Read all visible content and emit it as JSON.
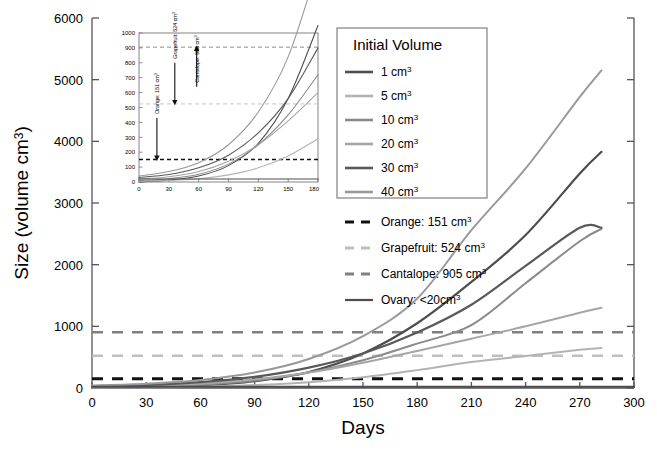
{
  "figure": {
    "axis": {
      "ylabel": "Size (volume cm3)",
      "ylabel_base": "Size (volume cm",
      "ylabel_sup": "3",
      "ylabel_tail": ")",
      "xlabel": "Days",
      "yticks": [
        0,
        1000,
        2000,
        3000,
        4000,
        5000,
        6000
      ],
      "xticks": [
        0,
        30,
        60,
        90,
        120,
        150,
        180,
        210,
        240,
        270,
        300
      ],
      "ylim": [
        0,
        6000
      ],
      "xlim": [
        0,
        300
      ],
      "grid": false
    },
    "legend": {
      "title": "Initial  Volume",
      "items": [
        {
          "label": "1 cm",
          "sup": "3",
          "color": "#4d4d4d"
        },
        {
          "label": "5 cm",
          "sup": "3",
          "color": "#b3b3b3"
        },
        {
          "label": "10 cm",
          "sup": "3",
          "color": "#8a8a8a"
        },
        {
          "label": "20 cm",
          "sup": "3",
          "color": "#a6a6a6"
        },
        {
          "label": "30 cm",
          "sup": "3",
          "color": "#595959"
        },
        {
          "label": "40 cm",
          "sup": "3",
          "color": "#999999"
        }
      ]
    },
    "reference_legend": [
      {
        "label": "Orange: 151 cm",
        "sup": "3",
        "color": "#111111",
        "style": "dashed"
      },
      {
        "label": "Grapefruit: 524 cm",
        "sup": "3",
        "color": "#bfbfbf",
        "style": "dashed"
      },
      {
        "label": "Cantalope:  905 cm",
        "sup": "3",
        "color": "#808080",
        "style": "dashed"
      },
      {
        "label": "Ovary: <20cm",
        "sup": "3",
        "color": "#4d4d4d",
        "style": "solid"
      }
    ],
    "inset": {
      "yticks": [
        0,
        100,
        200,
        300,
        400,
        500,
        600,
        700,
        800,
        900,
        1000
      ],
      "xticks": [
        0,
        30,
        60,
        90,
        120,
        150,
        180
      ],
      "ylim": [
        0,
        1000
      ],
      "xlim": [
        0,
        180
      ],
      "annotations": [
        {
          "text": "Orange: 151 cm3",
          "label": "Orange: 151 cm",
          "sup": "3",
          "x": 18,
          "y_from": 430,
          "y_to": 160
        },
        {
          "text": "Grapefruit: 524 cm3",
          "label": "Grapefruit: 524 cm",
          "sup": "3",
          "x": 36,
          "y_from": 800,
          "y_to": 533
        },
        {
          "text": "Cantalope: 905 cm3",
          "label": "Cantalope: 905 cm",
          "sup": "3",
          "x": 58,
          "y_from": 640,
          "y_to": 898
        }
      ]
    }
  },
  "chart_data": {
    "type": "line",
    "title": "",
    "xlabel": "Days",
    "ylabel": "Size (volume cm3)",
    "xlim": [
      0,
      300
    ],
    "ylim": [
      0,
      6000
    ],
    "grid": false,
    "legend_position": "upper-right",
    "x": [
      0,
      30,
      60,
      90,
      120,
      150,
      180,
      210,
      240,
      270,
      280
    ],
    "series": [
      {
        "name": "1 cm3",
        "color": "#4d4d4d",
        "width": 2.2,
        "x": [
          0,
          30,
          60,
          90,
          120,
          150,
          180,
          210,
          240,
          270,
          282
        ],
        "values": [
          1,
          12,
          40,
          110,
          260,
          560,
          1050,
          1720,
          2480,
          3480,
          3830
        ]
      },
      {
        "name": "5 cm3",
        "color": "#b3b3b3",
        "width": 2.0,
        "x": [
          0,
          30,
          60,
          90,
          120,
          150,
          180,
          210,
          240,
          270,
          282
        ],
        "values": [
          5,
          10,
          22,
          48,
          95,
          175,
          290,
          420,
          520,
          620,
          650
        ]
      },
      {
        "name": "10 cm3",
        "color": "#8a8a8a",
        "width": 2.0,
        "x": [
          0,
          30,
          60,
          90,
          120,
          150,
          180,
          210,
          240,
          270,
          282
        ],
        "values": [
          10,
          22,
          52,
          120,
          250,
          450,
          720,
          1020,
          1700,
          2380,
          2580
        ]
      },
      {
        "name": "20 cm3",
        "color": "#a6a6a6",
        "width": 2.0,
        "x": [
          0,
          30,
          60,
          90,
          120,
          150,
          180,
          210,
          240,
          270,
          282
        ],
        "values": [
          20,
          35,
          70,
          140,
          250,
          410,
          600,
          800,
          1000,
          1220,
          1300
        ]
      },
      {
        "name": "30 cm3",
        "color": "#595959",
        "width": 2.2,
        "x": [
          0,
          30,
          60,
          90,
          120,
          150,
          180,
          210,
          240,
          270,
          282
        ],
        "values": [
          30,
          50,
          95,
          180,
          330,
          560,
          900,
          1350,
          1980,
          2600,
          2600
        ]
      },
      {
        "name": "40 cm3",
        "color": "#999999",
        "width": 2.0,
        "x": [
          0,
          30,
          60,
          90,
          120,
          150,
          180,
          210,
          240,
          270,
          282
        ],
        "values": [
          40,
          70,
          130,
          250,
          470,
          840,
          1450,
          2560,
          3560,
          4720,
          5150
        ]
      },
      {
        "name": "Ovary",
        "color": "#4d4d4d",
        "width": 2.0,
        "x": [
          0,
          60,
          120,
          180,
          240,
          300
        ],
        "values": [
          20,
          20,
          20,
          20,
          20,
          20
        ]
      }
    ],
    "reference_lines": [
      {
        "name": "Orange",
        "value": 151,
        "color": "#111111",
        "style": "dashed",
        "width": 3.0
      },
      {
        "name": "Grapefruit",
        "value": 524,
        "color": "#bfbfbf",
        "style": "dashed",
        "width": 2.4
      },
      {
        "name": "Cantalope",
        "value": 905,
        "color": "#808080",
        "style": "dashed",
        "width": 2.4
      }
    ],
    "inset": {
      "type": "line",
      "xlim": [
        0,
        180
      ],
      "ylim": [
        0,
        1000
      ],
      "series": [
        {
          "name": "1 cm3",
          "color": "#4d4d4d",
          "x": [
            0,
            30,
            60,
            90,
            120,
            150,
            180
          ],
          "values": [
            1,
            12,
            40,
            110,
            260,
            560,
            1050
          ]
        },
        {
          "name": "5 cm3",
          "color": "#b3b3b3",
          "x": [
            0,
            30,
            60,
            90,
            120,
            150,
            180
          ],
          "values": [
            5,
            10,
            22,
            48,
            95,
            175,
            290
          ]
        },
        {
          "name": "10 cm3",
          "color": "#8a8a8a",
          "x": [
            0,
            30,
            60,
            90,
            120,
            150,
            180
          ],
          "values": [
            10,
            22,
            52,
            120,
            250,
            450,
            720
          ]
        },
        {
          "name": "20 cm3",
          "color": "#a6a6a6",
          "x": [
            0,
            30,
            60,
            90,
            120,
            150,
            180
          ],
          "values": [
            20,
            35,
            70,
            140,
            250,
            410,
            600
          ]
        },
        {
          "name": "30 cm3",
          "color": "#595959",
          "x": [
            0,
            30,
            60,
            90,
            120,
            150,
            180
          ],
          "values": [
            30,
            50,
            95,
            180,
            330,
            560,
            900
          ]
        },
        {
          "name": "40 cm3",
          "color": "#999999",
          "x": [
            0,
            30,
            60,
            90,
            120,
            150,
            180
          ],
          "values": [
            40,
            70,
            130,
            250,
            470,
            840,
            1450
          ]
        },
        {
          "name": "Ovary",
          "color": "#4d4d4d",
          "x": [
            0,
            90,
            180
          ],
          "values": [
            20,
            20,
            20
          ]
        }
      ],
      "reference_lines": [
        {
          "name": "Orange",
          "value": 151,
          "color": "#111111",
          "style": "dashed",
          "width": 1.4
        },
        {
          "name": "Grapefruit",
          "value": 524,
          "color": "#c4c4c4",
          "style": "dashed",
          "width": 1.0
        },
        {
          "name": "Cantalope",
          "value": 905,
          "color": "#8c8c8c",
          "style": "dashed",
          "width": 1.0
        }
      ]
    }
  }
}
